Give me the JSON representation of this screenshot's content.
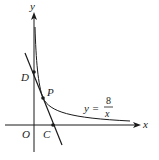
{
  "figure": {
    "type": "coordinate-plane",
    "axes": {
      "x_label": "x",
      "y_label": "y",
      "origin_label": "O"
    },
    "function": {
      "equation_lhs": "y =",
      "numerator": "8",
      "denominator": "x",
      "description": "hyperbola branch in first quadrant"
    },
    "points": [
      {
        "name": "D",
        "label": "D",
        "location": "line meets y-axis"
      },
      {
        "name": "P",
        "label": "P",
        "location": "line tangent/intersects curve"
      },
      {
        "name": "C",
        "label": "C",
        "location": "line meets x-axis"
      }
    ],
    "line": {
      "description": "line through D, P, C with negative slope"
    },
    "colors": {
      "stroke": "#1a1a1a",
      "background": "#ffffff"
    }
  }
}
